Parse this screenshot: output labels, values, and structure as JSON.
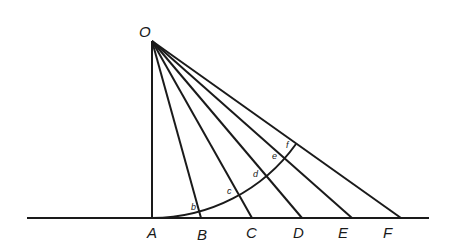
{
  "diagram": {
    "apex": {
      "label": "O",
      "x": 152,
      "y": 41,
      "label_x": 139,
      "label_y": 37
    },
    "baseline": {
      "x1": 27,
      "x2": 429,
      "y": 218
    },
    "base_points": [
      {
        "label": "A",
        "x": 152,
        "label_x": 147,
        "label_y": 238
      },
      {
        "label": "B",
        "x": 201,
        "label_x": 197,
        "label_y": 240
      },
      {
        "label": "C",
        "x": 252,
        "label_x": 246,
        "label_y": 238
      },
      {
        "label": "D",
        "x": 302,
        "label_x": 293,
        "label_y": 238
      },
      {
        "label": "E",
        "x": 352,
        "label_x": 338,
        "label_y": 238
      },
      {
        "label": "F",
        "x": 401,
        "label_x": 383,
        "label_y": 238
      }
    ],
    "arc": {
      "center_x": 152,
      "center_y": 41,
      "radius": 177
    },
    "arc_points": [
      {
        "label": "b",
        "x": 199,
        "y": 212,
        "label_x": 191,
        "label_y": 210
      },
      {
        "label": "c",
        "x": 239,
        "y": 195,
        "label_x": 227,
        "label_y": 194
      },
      {
        "label": "d",
        "x": 266,
        "y": 176,
        "label_x": 253,
        "label_y": 177
      },
      {
        "label": "e",
        "x": 285,
        "y": 158,
        "label_x": 272,
        "label_y": 159
      },
      {
        "label": "f",
        "x": 296,
        "y": 144,
        "label_x": 286,
        "label_y": 148
      }
    ],
    "stroke_color": "#1a1a1a",
    "background": "#ffffff"
  }
}
